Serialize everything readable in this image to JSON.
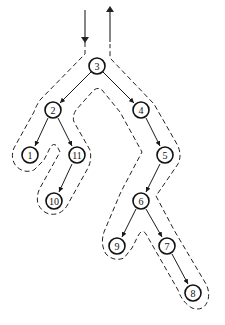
{
  "diagram": {
    "type": "binary-tree-euler-tour",
    "colors": {
      "stroke": "#111111",
      "background": "#ffffff"
    },
    "entry_arrow": {
      "direction": "down",
      "x": 85,
      "y1": 10,
      "y2": 40
    },
    "exit_arrow": {
      "direction": "up",
      "x": 110,
      "y1": 42,
      "y2": 8
    },
    "nodes": [
      {
        "id": "n3",
        "label": "3",
        "x": 97,
        "y": 66
      },
      {
        "id": "n2",
        "label": "2",
        "x": 53,
        "y": 110
      },
      {
        "id": "n4",
        "label": "4",
        "x": 141,
        "y": 110
      },
      {
        "id": "n1",
        "label": "1",
        "x": 30,
        "y": 155
      },
      {
        "id": "n11",
        "label": "11",
        "x": 77,
        "y": 155
      },
      {
        "id": "n10",
        "label": "10",
        "x": 54,
        "y": 201
      },
      {
        "id": "n5",
        "label": "5",
        "x": 165,
        "y": 155
      },
      {
        "id": "n6",
        "label": "6",
        "x": 141,
        "y": 201
      },
      {
        "id": "n9",
        "label": "9",
        "x": 117,
        "y": 246
      },
      {
        "id": "n7",
        "label": "7",
        "x": 167,
        "y": 246
      },
      {
        "id": "n8",
        "label": "8",
        "x": 193,
        "y": 293
      }
    ],
    "edges": [
      {
        "from": "3",
        "to": "2"
      },
      {
        "from": "3",
        "to": "4"
      },
      {
        "from": "2",
        "to": "1"
      },
      {
        "from": "2",
        "to": "11"
      },
      {
        "from": "11",
        "to": "10"
      },
      {
        "from": "4",
        "to": "5"
      },
      {
        "from": "5",
        "to": "6"
      },
      {
        "from": "6",
        "to": "9"
      },
      {
        "from": "6",
        "to": "7"
      },
      {
        "from": "7",
        "to": "8"
      }
    ]
  }
}
